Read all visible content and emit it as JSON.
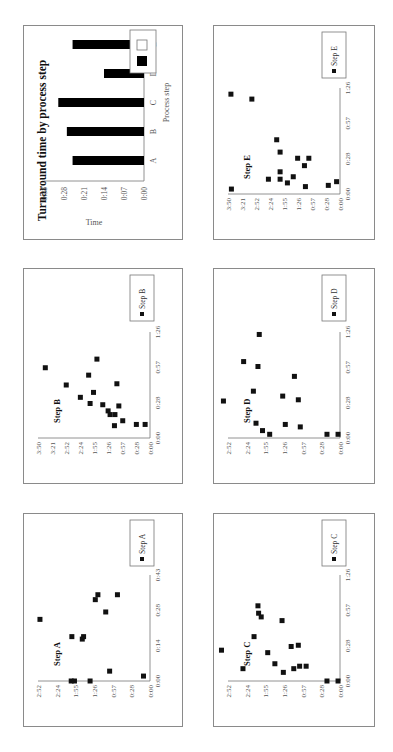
{
  "panels": {
    "bar": {
      "box": [
        23,
        25,
        160,
        215
      ]
    },
    "E": {
      "box": [
        213,
        25,
        162,
        215
      ]
    },
    "B": {
      "box": [
        23,
        268,
        160,
        216
      ]
    },
    "D": {
      "box": [
        213,
        268,
        162,
        216
      ]
    },
    "A": {
      "box": [
        23,
        513,
        160,
        214
      ]
    },
    "C": {
      "box": [
        213,
        513,
        162,
        214
      ]
    }
  },
  "chart_data": [
    {
      "id": "bar",
      "type": "bar",
      "title": "Turnaround time by process step",
      "xlabel": "Process step",
      "ylabel": "Time",
      "categories": [
        "A",
        "B",
        "C",
        "D",
        "E"
      ],
      "values": [
        "0:25",
        "0:27",
        "0:30",
        "0:14",
        "0:25"
      ],
      "values_seconds": [
        25,
        27,
        30,
        14,
        25
      ],
      "yticks": [
        "0:00",
        "0:07",
        "0:14",
        "0:21",
        "0:28",
        "0:38"
      ],
      "ylim_seconds": [
        0,
        35
      ],
      "legend": [
        {
          "swatch": "#000000",
          "label": ""
        },
        {
          "swatch": "#ffffff",
          "label": ""
        }
      ],
      "bar_color": "#000000",
      "rotation_deg": -90
    },
    {
      "id": "A",
      "type": "scatter",
      "title": "Step A",
      "legend": "Step A",
      "xticks": [
        "0:00",
        "0:14",
        "0:28",
        "0:43"
      ],
      "xlim_seconds": [
        0,
        43
      ],
      "yticks": [
        "0:00",
        "0:28",
        "0:57",
        "1:26",
        "1:55",
        "2:24",
        "2:52"
      ],
      "ylim_seconds": [
        0,
        172
      ],
      "points": [
        [
          25,
          169
        ],
        [
          0,
          121
        ],
        [
          0,
          116
        ],
        [
          18,
          120
        ],
        [
          17,
          104
        ],
        [
          18,
          102
        ],
        [
          0,
          92
        ],
        [
          33,
          84
        ],
        [
          35,
          80
        ],
        [
          28,
          68
        ],
        [
          4,
          62
        ],
        [
          35,
          50
        ],
        [
          2,
          10
        ]
      ],
      "rotation_deg": -90
    },
    {
      "id": "B",
      "type": "scatter",
      "title": "Step B",
      "legend": "Step B",
      "xticks": [
        "0:00",
        "0:28",
        "0:57",
        "1:26"
      ],
      "xlim_seconds": [
        0,
        86
      ],
      "yticks": [
        "0:00",
        "0:28",
        "0:57",
        "1:26",
        "1:55",
        "2:24",
        "2:52",
        "3:21",
        "3:50"
      ],
      "ylim_seconds": [
        0,
        230
      ],
      "points": [
        [
          57,
          215
        ],
        [
          43,
          172
        ],
        [
          33,
          143
        ],
        [
          51,
          126
        ],
        [
          28,
          123
        ],
        [
          37,
          116
        ],
        [
          64,
          109
        ],
        [
          27,
          97
        ],
        [
          22,
          86
        ],
        [
          19,
          82
        ],
        [
          19,
          72
        ],
        [
          10,
          73
        ],
        [
          44,
          68
        ],
        [
          26,
          64
        ],
        [
          14,
          56
        ],
        [
          11,
          28
        ],
        [
          11,
          10
        ]
      ],
      "rotation_deg": -90
    },
    {
      "id": "C",
      "type": "scatter",
      "title": "Step C",
      "legend": "Step C",
      "xticks": [
        "0:00",
        "0:28",
        "0:57",
        "1:26"
      ],
      "xlim_seconds": [
        0,
        86
      ],
      "yticks": [
        "0:00",
        "0:28",
        "0:57",
        "1:26",
        "1:55",
        "2:24",
        "2:52"
      ],
      "ylim_seconds": [
        0,
        172
      ],
      "points": [
        [
          25,
          182
        ],
        [
          10,
          149
        ],
        [
          36,
          132
        ],
        [
          61,
          126
        ],
        [
          55,
          125
        ],
        [
          52,
          121
        ],
        [
          23,
          111
        ],
        [
          14,
          100
        ],
        [
          49,
          89
        ],
        [
          7,
          87
        ],
        [
          28,
          75
        ],
        [
          10,
          71
        ],
        [
          29,
          64
        ],
        [
          12,
          62
        ],
        [
          12,
          52
        ],
        [
          0,
          20
        ],
        [
          0,
          3
        ]
      ],
      "rotation_deg": -90
    },
    {
      "id": "D",
      "type": "scatter",
      "title": "Step D",
      "legend": "Step D",
      "xticks": [
        "0:00",
        "0:28",
        "0:57",
        "1:26"
      ],
      "xlim_seconds": [
        0,
        86
      ],
      "yticks": [
        "0:00",
        "0:28",
        "0:57",
        "1:26",
        "1:55",
        "2:24",
        "2:52"
      ],
      "ylim_seconds": [
        0,
        172
      ],
      "points": [
        [
          30,
          179
        ],
        [
          62,
          148
        ],
        [
          38,
          133
        ],
        [
          12,
          129
        ],
        [
          58,
          126
        ],
        [
          84,
          124
        ],
        [
          6,
          119
        ],
        [
          3,
          108
        ],
        [
          34,
          88
        ],
        [
          11,
          84
        ],
        [
          50,
          70
        ],
        [
          31,
          64
        ],
        [
          9,
          61
        ],
        [
          3,
          20
        ],
        [
          3,
          3
        ]
      ],
      "rotation_deg": -90
    },
    {
      "id": "E",
      "type": "scatter",
      "title": "Step E",
      "legend": "Step E",
      "xticks": [
        "0:00",
        "0:28",
        "0:57",
        "1:26"
      ],
      "xlim_seconds": [
        0,
        86
      ],
      "yticks": [
        "0:00",
        "0:28",
        "0:57",
        "1:26",
        "1:55",
        "2:24",
        "2:52",
        "3:21",
        "3:50"
      ],
      "ylim_seconds": [
        0,
        230
      ],
      "points": [
        [
          4,
          223
        ],
        [
          81,
          224
        ],
        [
          77,
          181
        ],
        [
          12,
          147
        ],
        [
          44,
          130
        ],
        [
          34,
          123
        ],
        [
          18,
          123
        ],
        [
          12,
          123
        ],
        [
          9,
          108
        ],
        [
          14,
          96
        ],
        [
          29,
          87
        ],
        [
          23,
          73
        ],
        [
          6,
          71
        ],
        [
          29,
          64
        ],
        [
          7,
          24
        ],
        [
          10,
          7
        ]
      ],
      "rotation_deg": -90
    }
  ]
}
